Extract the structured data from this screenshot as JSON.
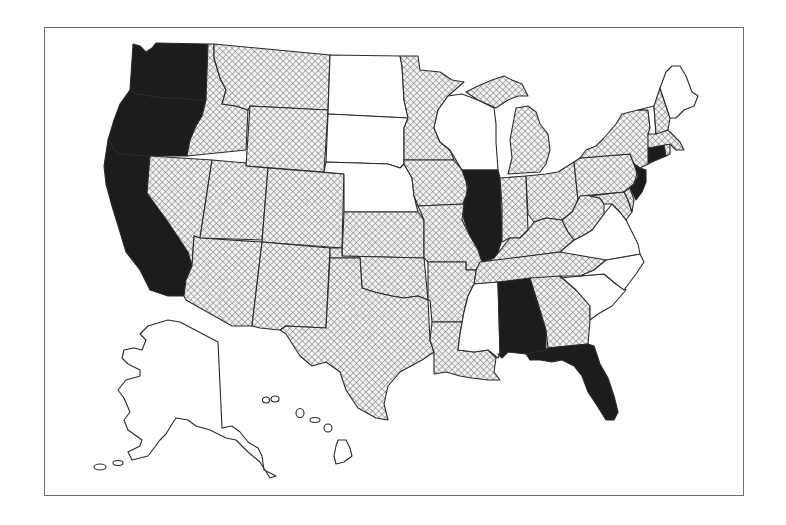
{
  "map": {
    "type": "us-states-choropleth",
    "frame": {
      "border_color": "#6e6e6e"
    },
    "categories": [
      {
        "id": "solid",
        "fill": "#1c1c1c",
        "description": "solid black fill"
      },
      {
        "id": "hatched",
        "fill": "crosshatch",
        "description": "cross-hatched pattern"
      },
      {
        "id": "none",
        "fill": "#ffffff",
        "description": "white / unfilled"
      }
    ],
    "states": {
      "WA": "solid",
      "OR": "solid",
      "CA": "solid",
      "IL": "solid",
      "AL": "solid",
      "FL": "solid",
      "NJ": "solid",
      "CT": "solid",
      "ID": "hatched",
      "MT": "hatched",
      "WY": "hatched",
      "NV": "hatched",
      "UT": "hatched",
      "CO": "hatched",
      "AZ": "hatched",
      "NM": "hatched",
      "KS": "hatched",
      "OK": "hatched",
      "TX": "hatched",
      "MN": "hatched",
      "IA": "hatched",
      "MO": "hatched",
      "AR": "hatched",
      "LA": "hatched",
      "MI": "hatched",
      "IN": "hatched",
      "OH": "hatched",
      "KY": "hatched",
      "TN": "hatched",
      "GA": "hatched",
      "WV": "hatched",
      "PA": "hatched",
      "NY": "hatched",
      "NH": "hatched",
      "MA": "hatched",
      "MD": "hatched",
      "DE": "hatched",
      "RI": "hatched",
      "ND": "none",
      "SD": "none",
      "NE": "none",
      "WI": "none",
      "MS": "none",
      "SC": "none",
      "NC": "none",
      "VA": "none",
      "VT": "none",
      "ME": "none",
      "AK": "none",
      "HI": "none"
    }
  }
}
